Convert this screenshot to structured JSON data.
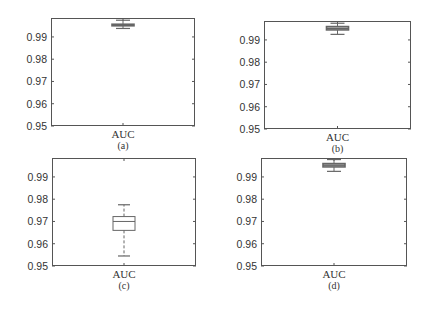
{
  "chart_data": [
    {
      "type": "box",
      "panel": "(a)",
      "categories": [
        "AUC"
      ],
      "xlabel": "AUC",
      "caption": "(a)",
      "ylim": [
        0.95,
        0.9985
      ],
      "yticks": [
        "0.95",
        "0.96",
        "0.97",
        "0.98",
        "0.99"
      ],
      "box": {
        "whisker_low": 0.9938,
        "q1": 0.995,
        "median": 0.9953,
        "q3": 0.9957,
        "whisker_high": 0.9975
      }
    },
    {
      "type": "box",
      "panel": "(b)",
      "categories": [
        "AUC"
      ],
      "xlabel": "AUC",
      "caption": "(b)",
      "ylim": [
        0.95,
        0.9985
      ],
      "yticks": [
        "0.95",
        "0.96",
        "0.97",
        "0.98",
        "0.99"
      ],
      "box": {
        "whisker_low": 0.9925,
        "q1": 0.9945,
        "median": 0.9952,
        "q3": 0.996,
        "whisker_high": 0.9975
      }
    },
    {
      "type": "box",
      "panel": "(c)",
      "categories": [
        "AUC"
      ],
      "xlabel": "AUC",
      "caption": "(c)",
      "ylim": [
        0.95,
        0.9985
      ],
      "yticks": [
        "0.95",
        "0.96",
        "0.97",
        "0.98",
        "0.99"
      ],
      "box": {
        "whisker_low": 0.9545,
        "q1": 0.966,
        "median": 0.97,
        "q3": 0.9722,
        "whisker_high": 0.9775
      }
    },
    {
      "type": "box",
      "panel": "(d)",
      "categories": [
        "AUC"
      ],
      "xlabel": "AUC",
      "caption": "(d)",
      "ylim": [
        0.95,
        0.9985
      ],
      "yticks": [
        "0.95",
        "0.96",
        "0.97",
        "0.98",
        "0.99"
      ],
      "box": {
        "whisker_low": 0.9925,
        "q1": 0.9945,
        "median": 0.9953,
        "q3": 0.996,
        "whisker_high": 0.9978
      }
    }
  ],
  "style": {
    "frame_color": "#555555",
    "box_color": "#666666",
    "text_color": "#333333"
  }
}
